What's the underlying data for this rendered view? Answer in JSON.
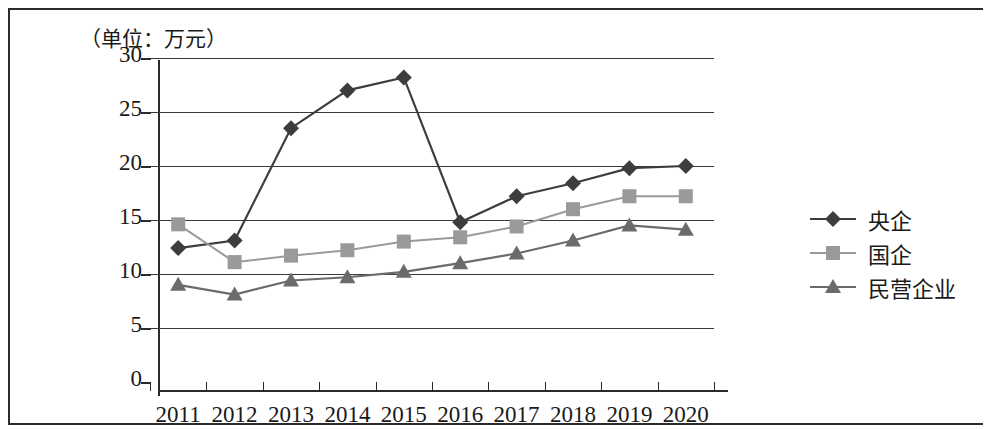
{
  "figure": {
    "unit_title": "（单位：万元）"
  },
  "chart_data": {
    "type": "line",
    "title": "（单位：万元）",
    "xlabel": "",
    "ylabel": "万元",
    "categories": [
      "2011",
      "2012",
      "2013",
      "2014",
      "2015",
      "2016",
      "2017",
      "2018",
      "2019",
      "2020"
    ],
    "ylim": [
      0,
      30
    ],
    "yticks": [
      0,
      5,
      10,
      15,
      20,
      25,
      30
    ],
    "grid": true,
    "legend_position": "right",
    "series": [
      {
        "name": "央企",
        "marker": "diamond",
        "color": "#3d3d3d",
        "values": [
          12.4,
          13.1,
          23.5,
          27.0,
          28.2,
          14.8,
          17.2,
          18.4,
          19.8,
          20.0
        ]
      },
      {
        "name": "国企",
        "marker": "square",
        "color": "#9a9a9a",
        "values": [
          14.6,
          11.1,
          11.7,
          12.2,
          13.0,
          13.4,
          14.4,
          16.0,
          17.2,
          17.2
        ]
      },
      {
        "name": "民营企业",
        "marker": "triangle",
        "color": "#6b6b6b",
        "values": [
          9.0,
          8.1,
          9.4,
          9.7,
          10.2,
          11.0,
          11.9,
          13.1,
          14.5,
          14.1
        ]
      }
    ]
  }
}
